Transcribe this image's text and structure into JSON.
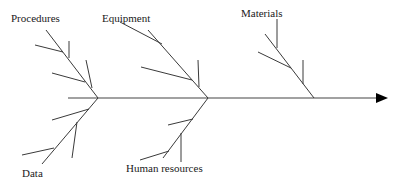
{
  "diagram": {
    "type": "fishbone",
    "spine": {
      "direction": "right",
      "arrow": true
    },
    "categories": {
      "procedures": {
        "label": "Procedures",
        "position": "top-left"
      },
      "equipment": {
        "label": "Equipment",
        "position": "top-middle"
      },
      "materials": {
        "label": "Materials",
        "position": "top-right"
      },
      "data": {
        "label": "Data",
        "position": "bottom-left"
      },
      "human_resources": {
        "label": "Human resources",
        "position": "bottom-middle"
      }
    },
    "colors": {
      "line": "#3a3a3a",
      "arrow": "#000000",
      "background": "#ffffff",
      "text": "#1a1a1a"
    }
  }
}
